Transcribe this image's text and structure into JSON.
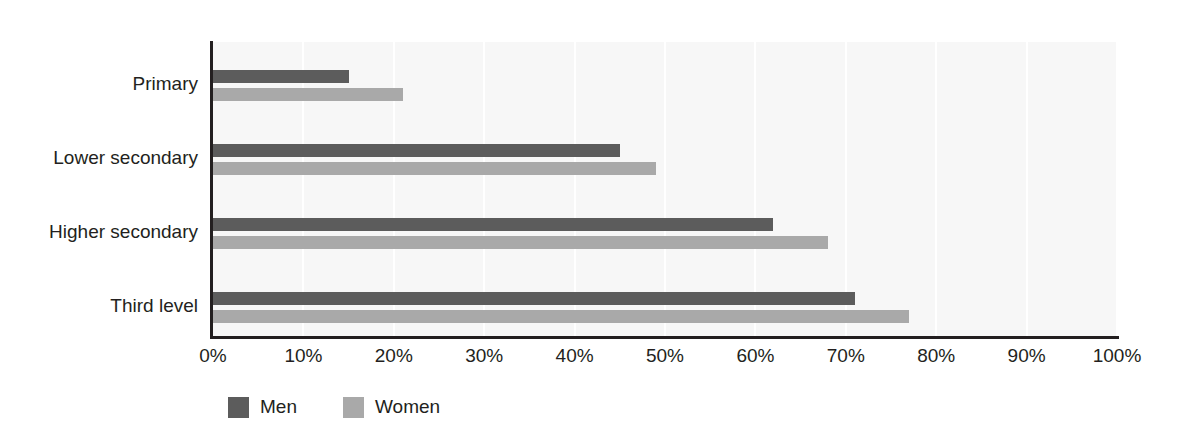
{
  "chart_data": {
    "type": "bar",
    "orientation": "horizontal",
    "title": "",
    "subtitle": "",
    "xlabel": "",
    "ylabel": "",
    "xlim": [
      0,
      100
    ],
    "grid": true,
    "grid_axis": "x",
    "legend_position": "bottom-left",
    "categories": [
      "Primary",
      "Lower secondary",
      "Higher secondary",
      "Third level"
    ],
    "xticks": [
      0,
      10,
      20,
      30,
      40,
      50,
      60,
      70,
      80,
      90,
      100
    ],
    "xticklabels": [
      "0%",
      "10%",
      "20%",
      "30%",
      "40%",
      "50%",
      "60%",
      "70%",
      "80%",
      "90%",
      "100%"
    ],
    "series": [
      {
        "name": "Men",
        "color": "#5c5c5c",
        "values": [
          15,
          45,
          62,
          71
        ]
      },
      {
        "name": "Women",
        "color": "#a9a9a9",
        "values": [
          21,
          49,
          68,
          77
        ]
      }
    ]
  },
  "legend": {
    "items": [
      {
        "label": "Men",
        "color": "#5c5c5c"
      },
      {
        "label": "Women",
        "color": "#a9a9a9"
      }
    ]
  },
  "colors": {
    "men": "#5c5c5c",
    "women": "#a9a9a9",
    "plot_background": "#f7f7f7",
    "axis": "#231f20",
    "gridline": "#ffffff",
    "page_background": "#ffffff"
  }
}
